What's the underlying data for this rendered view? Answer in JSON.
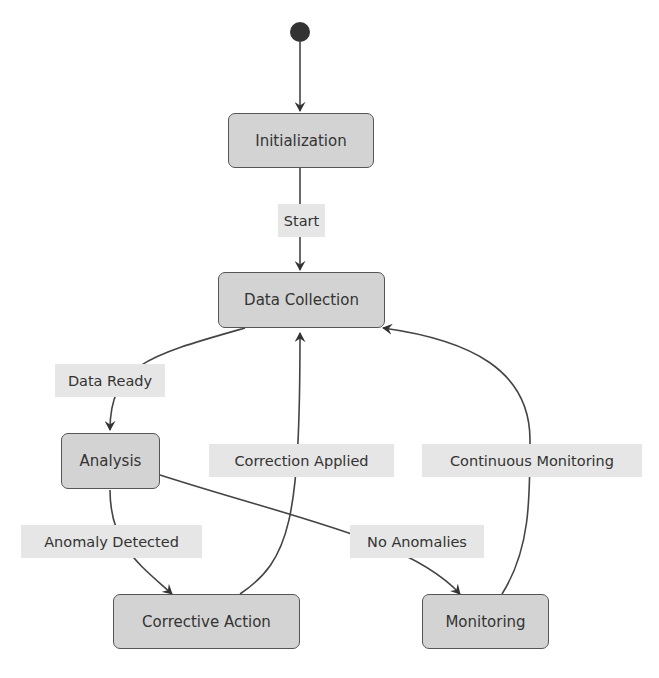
{
  "diagram": {
    "type": "state-diagram",
    "colors": {
      "state_fill": "#d3d3d3",
      "state_border": "#555555",
      "edge": "#333333",
      "label_bg": "#e6e6e6",
      "text": "#333333"
    },
    "initial_node": "start",
    "states": [
      {
        "id": "initialization",
        "label": "Initialization"
      },
      {
        "id": "data_collection",
        "label": "Data Collection"
      },
      {
        "id": "analysis",
        "label": "Analysis"
      },
      {
        "id": "corrective_action",
        "label": "Corrective Action"
      },
      {
        "id": "monitoring",
        "label": "Monitoring"
      }
    ],
    "transitions": [
      {
        "from": "start",
        "to": "initialization",
        "label": ""
      },
      {
        "from": "initialization",
        "to": "data_collection",
        "label": "Start"
      },
      {
        "from": "data_collection",
        "to": "analysis",
        "label": "Data Ready"
      },
      {
        "from": "analysis",
        "to": "corrective_action",
        "label": "Anomaly Detected"
      },
      {
        "from": "analysis",
        "to": "monitoring",
        "label": "No Anomalies"
      },
      {
        "from": "corrective_action",
        "to": "data_collection",
        "label": "Correction Applied"
      },
      {
        "from": "monitoring",
        "to": "data_collection",
        "label": "Continuous Monitoring"
      }
    ]
  }
}
